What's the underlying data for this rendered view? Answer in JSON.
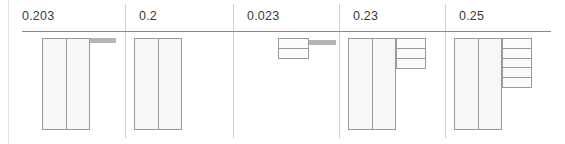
{
  "figure": {
    "type": "panel-grid-schematic",
    "width": 565,
    "height": 144,
    "background": "#ffffff",
    "rule_color": "#8a8a8a",
    "separator_color": "#cfcfcf",
    "outline_color": "#9a9a9a",
    "fill_color": "#fafafa",
    "accent_gray": "#b5b5b5"
  },
  "panels": [
    {
      "id": "panel-1",
      "label": "0.203",
      "x": 8,
      "width": 117,
      "tall_bars": 2,
      "stack_cells": 0,
      "has_gray_bar": true,
      "has_minibox": false,
      "bar_height": 92,
      "bars_left": 34,
      "bars_width": 48,
      "gray_bar_left": 82,
      "gray_bar_width": 26,
      "gray_bar_top": 2,
      "gray_bar_height": 5
    },
    {
      "id": "panel-2",
      "label": "0.2",
      "x": 125,
      "width": 108,
      "tall_bars": 2,
      "stack_cells": 0,
      "has_gray_bar": false,
      "has_minibox": false,
      "bar_height": 92,
      "bars_left": 9,
      "bars_width": 48,
      "gray_bar_left": 0,
      "gray_bar_width": 0,
      "gray_bar_top": 0,
      "gray_bar_height": 0
    },
    {
      "id": "panel-3",
      "label": "0.023",
      "x": 233,
      "width": 106,
      "tall_bars": 0,
      "stack_cells": 0,
      "has_gray_bar": true,
      "has_minibox": true,
      "minibox_left": 45,
      "minibox_top": 2,
      "minibox_width": 31,
      "minibox_height": 21,
      "gray_bar_left": 76,
      "gray_bar_width": 27,
      "gray_bar_top": 4,
      "gray_bar_height": 5
    },
    {
      "id": "panel-4",
      "label": "0.23",
      "x": 339,
      "width": 106,
      "tall_bars": 2,
      "stack_cells": 3,
      "has_gray_bar": false,
      "has_minibox": false,
      "bar_height": 92,
      "bars_left": 9,
      "bars_width": 48,
      "stack_left": 57,
      "stack_top": 2,
      "stack_width": 30,
      "stack_height": 31
    },
    {
      "id": "panel-5",
      "label": "0.25",
      "x": 445,
      "width": 106,
      "tall_bars": 2,
      "stack_cells": 5,
      "has_gray_bar": false,
      "has_minibox": false,
      "bar_height": 92,
      "bars_left": 9,
      "bars_width": 48,
      "stack_left": 57,
      "stack_top": 2,
      "stack_width": 30,
      "stack_height": 50
    }
  ],
  "header_rule": {
    "left": 22,
    "right": 551,
    "top": 31
  },
  "separators": [
    125,
    233,
    339,
    445
  ],
  "edge_rule_x": 8
}
